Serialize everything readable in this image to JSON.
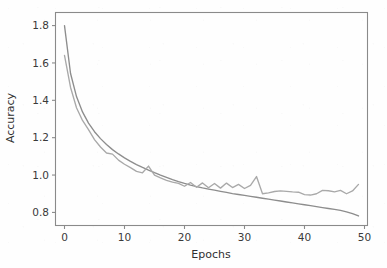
{
  "chart_data": {
    "type": "line",
    "title": "",
    "xlabel": "Epochs",
    "ylabel": "Accuracy",
    "xlim": [
      -1.5,
      50.5
    ],
    "ylim": [
      0.73,
      1.87
    ],
    "xticks": [
      0,
      10,
      20,
      30,
      40,
      50
    ],
    "xtick_labels": [
      "0",
      "10",
      "20",
      "30",
      "40",
      "50"
    ],
    "yticks": [
      0.8,
      1.0,
      1.2,
      1.4,
      1.6,
      1.8
    ],
    "ytick_labels": [
      "0.8",
      "1.0",
      "1.2",
      "1.4",
      "1.6",
      "1.8"
    ],
    "grid": false,
    "legend": null,
    "x": [
      0,
      1,
      2,
      3,
      4,
      5,
      6,
      7,
      8,
      9,
      10,
      11,
      12,
      13,
      14,
      15,
      16,
      17,
      18,
      19,
      20,
      21,
      22,
      23,
      24,
      25,
      26,
      27,
      28,
      29,
      30,
      31,
      32,
      33,
      34,
      35,
      36,
      37,
      38,
      39,
      40,
      41,
      42,
      43,
      44,
      45,
      46,
      47,
      48,
      49
    ],
    "series": [
      {
        "name": "training",
        "color": "#8d8d8d",
        "values": [
          1.8,
          1.545,
          1.42,
          1.338,
          1.278,
          1.232,
          1.195,
          1.163,
          1.136,
          1.113,
          1.092,
          1.073,
          1.056,
          1.041,
          1.027,
          1.013,
          1.0,
          0.988,
          0.976,
          0.965,
          0.955,
          0.946,
          0.938,
          0.931,
          0.925,
          0.919,
          0.913,
          0.907,
          0.901,
          0.896,
          0.891,
          0.886,
          0.881,
          0.876,
          0.871,
          0.866,
          0.861,
          0.856,
          0.851,
          0.846,
          0.841,
          0.836,
          0.831,
          0.826,
          0.821,
          0.816,
          0.811,
          0.803,
          0.793,
          0.781
        ]
      },
      {
        "name": "validation",
        "color": "#a9a9a9",
        "values": [
          1.64,
          1.47,
          1.36,
          1.292,
          1.243,
          1.19,
          1.15,
          1.118,
          1.112,
          1.08,
          1.058,
          1.04,
          1.02,
          1.012,
          1.048,
          1.0,
          0.985,
          0.972,
          0.962,
          0.955,
          0.94,
          0.96,
          0.935,
          0.958,
          0.932,
          0.955,
          0.93,
          0.957,
          0.933,
          0.95,
          0.928,
          0.945,
          0.992,
          0.9,
          0.905,
          0.912,
          0.915,
          0.913,
          0.91,
          0.908,
          0.895,
          0.893,
          0.9,
          0.918,
          0.916,
          0.91,
          0.918,
          0.9,
          0.915,
          0.95
        ]
      }
    ]
  },
  "figure": {
    "background_color": "#fefefe",
    "axis_color": "#8a8a8a",
    "text_color": "#3a3a3a"
  }
}
